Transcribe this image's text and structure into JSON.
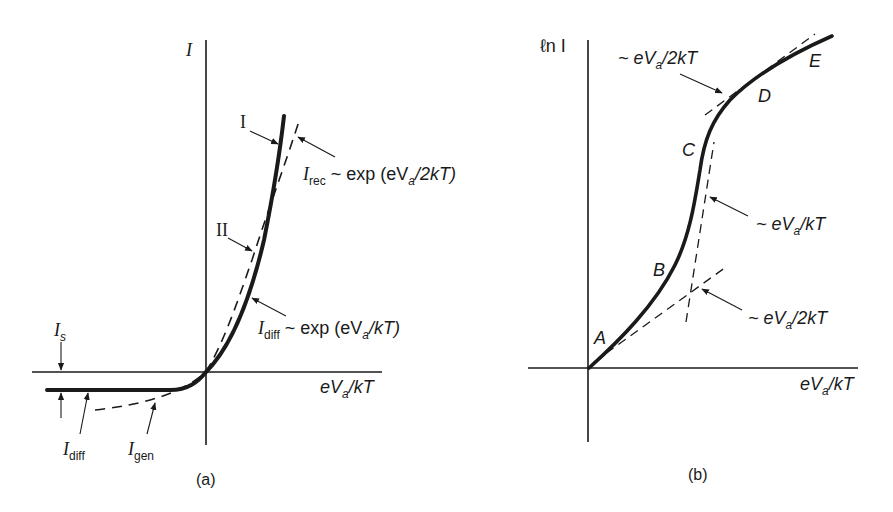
{
  "figure": {
    "panel_a": {
      "caption": "(a)",
      "y_axis_label": "I",
      "x_axis_label": "eV_a/kT",
      "annotations": {
        "curve_I": "I",
        "curve_II": "II",
        "I_rec": {
          "main": "I",
          "sub": "rec",
          "rest": " ~ exp (eV",
          "sub2": "a",
          "tail": "/2kT)"
        },
        "I_diff_forward": {
          "main": "I",
          "sub": "diff",
          "rest": " ~ exp (eV",
          "sub2": "a",
          "tail": "/kT)"
        },
        "I_s": {
          "main": "I",
          "sub": "s"
        },
        "I_diff_reverse": {
          "main": "I",
          "sub": "diff"
        },
        "I_gen": {
          "main": "I",
          "sub": "gen"
        }
      },
      "x_label_parts": {
        "e": "eV",
        "sub": "a",
        "tail": "/kT"
      }
    },
    "panel_b": {
      "caption": "(b)",
      "y_axis_label": "ℓn I",
      "x_axis_label": "eV_a/kT",
      "region_labels": [
        "A",
        "B",
        "C",
        "D",
        "E"
      ],
      "slope_top": {
        "pre": "~ eV",
        "sub": "a",
        "tail": "/2kT"
      },
      "slope_mid": {
        "pre": "~ eV",
        "sub": "a",
        "tail": "/kT"
      },
      "slope_bottom": {
        "pre": "~ eV",
        "sub": "a",
        "tail": "/2kT"
      },
      "x_label_parts": {
        "e": "eV",
        "sub": "a",
        "tail": "/kT"
      }
    },
    "colors": {
      "ink": "#1a1a1a",
      "background": "#ffffff"
    }
  }
}
